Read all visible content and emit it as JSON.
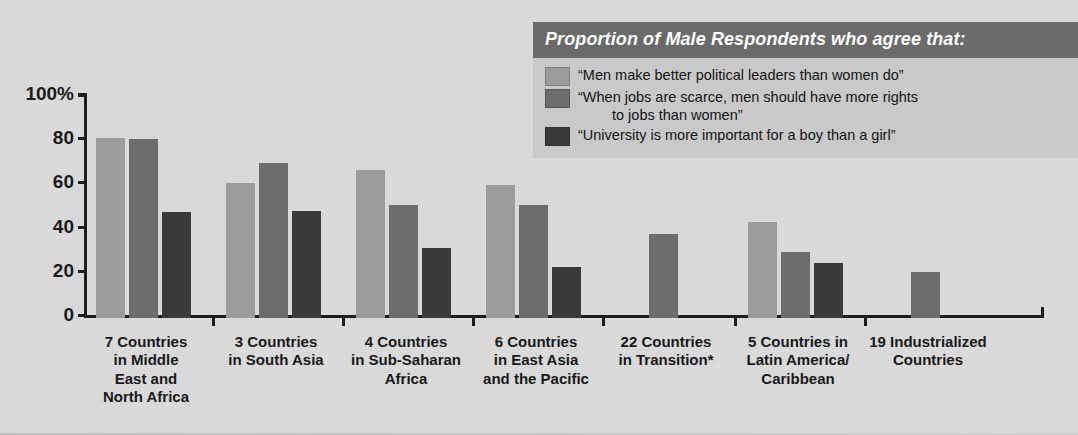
{
  "legend": {
    "header": "Proportion of Male Respondents who agree that:",
    "items": [
      {
        "label": "“Men make better political leaders than women do”",
        "label_cont": "",
        "color": "#9c9c9c",
        "swatch_name": "legend-swatch-political-leaders"
      },
      {
        "label": "“When jobs are scarce, men should have more rights",
        "label_cont": "to jobs than women”",
        "color": "#6d6d6d",
        "swatch_name": "legend-swatch-jobs-rights"
      },
      {
        "label": "“University is more important for a boy than a girl”",
        "label_cont": "",
        "color": "#3a3a3a",
        "swatch_name": "legend-swatch-university"
      }
    ]
  },
  "axis": {
    "y_ticks": [
      "100%",
      "80",
      "60",
      "40",
      "20",
      "0"
    ],
    "y_tick_values": [
      100,
      80,
      60,
      40,
      20,
      0
    ]
  },
  "chart_data": {
    "type": "bar",
    "title": "Proportion of Male Respondents who agree that:",
    "xlabel": "",
    "ylabel": "",
    "ylim": [
      0,
      100
    ],
    "yticks": [
      0,
      20,
      40,
      60,
      80,
      100
    ],
    "ytick_labels": [
      "0",
      "20",
      "40",
      "60",
      "80",
      "100%"
    ],
    "grid": false,
    "legend_position": "top-right",
    "categories": [
      "7 Countries in Middle East and North Africa",
      "3 Countries in South Asia",
      "4 Countries in Sub-Saharan Africa",
      "6 Countries in East Asia and the Pacific",
      "22 Countries in Transition*",
      "5 Countries in Latin America/ Caribbean",
      "19 Industrialized Countries"
    ],
    "category_lines": [
      [
        "7 Countries",
        "in Middle",
        "East and",
        "North Africa"
      ],
      [
        "3 Countries",
        "in South Asia"
      ],
      [
        "4 Countries",
        "in Sub-Saharan",
        "Africa"
      ],
      [
        "6 Countries",
        "in East Asia",
        "and the Pacific"
      ],
      [
        "22 Countries",
        "in Transition*"
      ],
      [
        "5 Countries in",
        "Latin America/",
        "Caribbean"
      ],
      [
        "19 Industrialized",
        "Countries"
      ]
    ],
    "series": [
      {
        "name": "“Men make better political leaders than women do”",
        "color": "#9c9c9c",
        "values": [
          81.5,
          61,
          67,
          60,
          null,
          43.5,
          null
        ]
      },
      {
        "name": "“When jobs are scarce, men should have more rights to jobs than women”",
        "color": "#6d6d6d",
        "values": [
          81,
          70,
          51,
          51,
          38,
          30,
          21
        ]
      },
      {
        "name": "“University is more important for a boy than a girl”",
        "color": "#3a3a3a",
        "values": [
          48,
          48.5,
          31.5,
          23,
          null,
          25,
          null
        ]
      }
    ]
  }
}
